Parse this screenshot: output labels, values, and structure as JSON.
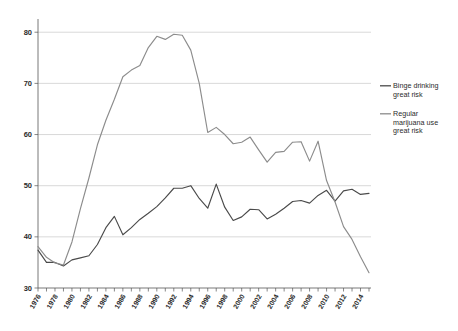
{
  "chart_data": {
    "type": "line",
    "title": "",
    "subtitle": "",
    "xlabel": "",
    "ylabel": "",
    "xlim": [
      1976,
      2015
    ],
    "ylim": [
      30,
      82
    ],
    "ytick_values": [
      30,
      40,
      50,
      60,
      70,
      80
    ],
    "ytick_labels": [
      "30",
      "40",
      "50",
      "60",
      "70",
      "80"
    ],
    "xtick_labels": [
      "1976",
      "1978",
      "1980",
      "1982",
      "1984",
      "1986",
      "1988",
      "1990",
      "1992",
      "1994",
      "1996",
      "1998",
      "2000",
      "2002",
      "2004",
      "2006",
      "2008",
      "2010",
      "2012",
      "2014"
    ],
    "xtick_values": [
      1976,
      1978,
      1980,
      1982,
      1984,
      1986,
      1988,
      1990,
      1992,
      1994,
      1996,
      1998,
      2000,
      2002,
      2004,
      2006,
      2008,
      2010,
      2012,
      2014
    ],
    "x": [
      1976,
      1977,
      1978,
      1979,
      1980,
      1981,
      1982,
      1983,
      1984,
      1985,
      1986,
      1987,
      1988,
      1989,
      1990,
      1991,
      1992,
      1993,
      1994,
      1995,
      1996,
      1997,
      1998,
      1999,
      2000,
      2001,
      2002,
      2003,
      2004,
      2005,
      2006,
      2007,
      2008,
      2009,
      2010,
      2011,
      2012,
      2013,
      2014,
      2015
    ],
    "grid": "horizontal",
    "legend_position": "right",
    "series": [
      {
        "name": "Binge drinking great risk",
        "legend_label_line1": "Binge drinking",
        "legend_label_line2": "great risk",
        "color": "#4a4a4a",
        "values": [
          37.4,
          35.0,
          35.0,
          34.3,
          35.5,
          35.9,
          36.3,
          38.5,
          41.8,
          44.0,
          40.4,
          41.8,
          43.4,
          44.6,
          45.9,
          47.6,
          49.5,
          49.5,
          50.0,
          47.5,
          45.6,
          50.3,
          45.8,
          43.2,
          43.9,
          45.4,
          45.3,
          43.5,
          44.4,
          45.6,
          46.9,
          47.1,
          46.6,
          48.1,
          49.1,
          47.0,
          49.0,
          49.3,
          48.3,
          48.5
        ]
      },
      {
        "name": "Regular marijuana use great risk",
        "legend_label_line1": "Regular",
        "legend_label_line2": "marijuana use",
        "legend_label_line3": "great risk",
        "color": "#8c8c8c",
        "values": [
          38.1,
          36.0,
          34.9,
          34.5,
          39.0,
          45.5,
          51.5,
          58.0,
          62.8,
          66.9,
          71.3,
          72.6,
          73.5,
          77.0,
          79.2,
          78.6,
          79.6,
          79.4,
          76.5,
          70.0,
          60.4,
          61.4,
          60.0,
          58.2,
          58.5,
          59.5,
          57.0,
          54.6,
          56.5,
          56.7,
          58.5,
          58.6,
          54.8,
          58.7,
          51.0,
          46.8,
          42.0,
          39.5,
          36.1,
          33.0
        ]
      }
    ]
  },
  "axis": {
    "y_axis_name": "y-axis",
    "x_axis_name": "x-axis"
  }
}
